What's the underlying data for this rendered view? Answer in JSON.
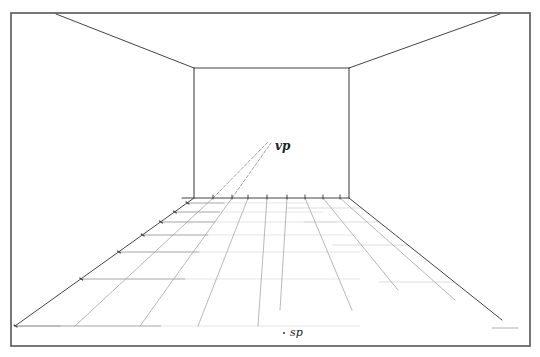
{
  "diagram": {
    "labels": {
      "vanishing_point": "vp",
      "station_point": "sp"
    },
    "colors": {
      "frame": "#555555",
      "edge": "#444444",
      "guide": "#9a9a9a",
      "faint": "#c8c8c8",
      "dashed": "#777777",
      "background": "#ffffff"
    },
    "frame": {
      "x1": 11,
      "y1": 13,
      "x2": 530,
      "y2": 346
    },
    "back_wall": {
      "x1": 194,
      "y1": 68,
      "x2": 349,
      "y2": 198
    },
    "vanishing_point": {
      "x": 271,
      "y": 140
    },
    "station_point": {
      "x": 283,
      "y": 332
    },
    "ceiling_lines": [
      {
        "x1": 56,
        "y1": 14,
        "x2": 194,
        "y2": 68
      },
      {
        "x1": 349,
        "y1": 68,
        "x2": 500,
        "y2": 14
      }
    ],
    "floor_edges": [
      {
        "x1": 194,
        "y1": 198,
        "x2": 15,
        "y2": 326
      },
      {
        "x1": 349,
        "y1": 198,
        "x2": 502,
        "y2": 320
      }
    ],
    "floor_orthogonals_top_x": [
      213,
      232,
      248,
      267,
      287,
      305,
      323,
      340
    ],
    "floor_orthogonals_bottom": [
      {
        "x": 75,
        "y": 326
      },
      {
        "x": 140,
        "y": 326
      },
      {
        "x": 198,
        "y": 326
      },
      {
        "x": 258,
        "y": 326
      },
      {
        "x": 280,
        "y": 310
      },
      {
        "x": 352,
        "y": 310
      },
      {
        "x": 398,
        "y": 290
      },
      {
        "x": 455,
        "y": 300
      }
    ],
    "floor_transversals_y": [
      203,
      212,
      222,
      235,
      252,
      279,
      326
    ],
    "dashed_rays": [
      {
        "x1": 213,
        "y1": 198,
        "x2": 269,
        "y2": 141
      },
      {
        "x1": 232,
        "y1": 198,
        "x2": 271,
        "y2": 143
      }
    ],
    "bottom_marks": [
      {
        "x1": 15,
        "y1": 326,
        "x2": 60,
        "y2": 326
      },
      {
        "x1": 492,
        "y1": 328,
        "x2": 518,
        "y2": 328
      }
    ]
  }
}
